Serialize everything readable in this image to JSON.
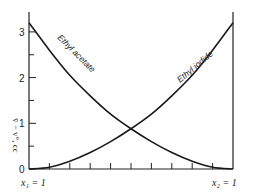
{
  "chart_data": {
    "type": "line",
    "title": "",
    "xlabel": "",
    "ylabel": "v̄ − v°, cc",
    "x_end_labels": {
      "left": "x₁ = 1",
      "right": "x₂ = 1"
    },
    "ylim": [
      0,
      3.2
    ],
    "yticks": [
      0,
      1,
      2,
      3
    ],
    "ytick_labels": [
      "0",
      "1",
      "2",
      "3"
    ],
    "x": [
      0,
      0.1,
      0.2,
      0.3,
      0.4,
      0.5,
      0.6,
      0.7,
      0.8,
      0.9,
      1.0
    ],
    "series": [
      {
        "name": "Ethyl acetate",
        "values": [
          3.2,
          2.6,
          2.05,
          1.6,
          1.2,
          0.88,
          0.6,
          0.36,
          0.17,
          0.04,
          0.0
        ]
      },
      {
        "name": "Ethyl iodide",
        "values": [
          0.0,
          0.04,
          0.17,
          0.36,
          0.6,
          0.88,
          1.2,
          1.6,
          2.05,
          2.6,
          3.2
        ]
      }
    ],
    "x_minor_ticks": 9,
    "intersection": {
      "x": 0.5,
      "y": 0.9
    },
    "grid": false,
    "legend": "inline labels along curves"
  }
}
